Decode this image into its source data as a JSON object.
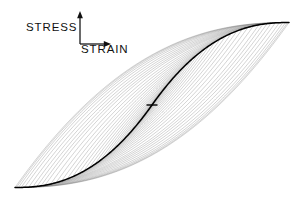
{
  "figure": {
    "background_color": "#ffffff",
    "width": 306,
    "height": 203
  },
  "axes": {
    "origin": {
      "x": 80,
      "y": 44
    },
    "vertical": {
      "label": "STRESS",
      "direction": "up",
      "tip": {
        "x": 80,
        "y": 11
      },
      "icon": "up-arrow-icon",
      "color": "#111111"
    },
    "horizontal": {
      "label": "STRAIN",
      "direction": "right",
      "tip": {
        "x": 111,
        "y": 44
      },
      "icon": "right-arrow-icon",
      "color": "#111111"
    }
  },
  "chart_data": {
    "type": "line",
    "title": "",
    "subtitle": "",
    "xlabel": "STRAIN",
    "ylabel": "STRESS",
    "grid": false,
    "legend": null,
    "axis_style": "arrow-indicator-only",
    "tick_labels": {
      "x": [],
      "y": []
    },
    "center": {
      "x": 152,
      "y": 105
    },
    "extent": {
      "bottom_left_tip": {
        "x": 19,
        "y": 192
      },
      "top_right_tip": {
        "x": 293,
        "y": 27
      }
    },
    "loop_count": 28,
    "loop_color": "#4a4a4a",
    "loop_opacity": 0.55,
    "loop_stroke_width": 0.45,
    "backbone": {
      "name": "skeleton-curve",
      "color": "#000000",
      "stroke_width": 1.5,
      "shape": "antisymmetric-S",
      "start": {
        "x": 19,
        "y": 192
      },
      "end": {
        "x": 293,
        "y": 27
      }
    },
    "center_marker": {
      "name": "center-tick",
      "color": "#000000",
      "width": 11,
      "height": 1.4
    },
    "series": [
      {
        "name": "backbone",
        "role": "skeleton-curve",
        "points_normalized": [
          [
            -1.0,
            -1.0
          ],
          [
            -0.86,
            -0.925
          ],
          [
            -0.72,
            -0.845
          ],
          [
            -0.58,
            -0.755
          ],
          [
            -0.44,
            -0.645
          ],
          [
            -0.32,
            -0.53
          ],
          [
            -0.22,
            -0.405
          ],
          [
            -0.14,
            -0.285
          ],
          [
            -0.07,
            -0.15
          ],
          [
            0.0,
            0.0
          ],
          [
            0.07,
            0.15
          ],
          [
            0.14,
            0.285
          ],
          [
            0.22,
            0.405
          ],
          [
            0.32,
            0.53
          ],
          [
            0.44,
            0.645
          ],
          [
            0.58,
            0.755
          ],
          [
            0.72,
            0.845
          ],
          [
            0.86,
            0.925
          ],
          [
            1.0,
            1.0
          ]
        ]
      },
      {
        "name": "hysteresis-loops",
        "role": "nested-loops",
        "amplitudes_normalized": [
          0.06,
          0.1,
          0.14,
          0.18,
          0.22,
          0.26,
          0.3,
          0.34,
          0.38,
          0.42,
          0.46,
          0.5,
          0.54,
          0.58,
          0.62,
          0.66,
          0.7,
          0.74,
          0.78,
          0.81,
          0.84,
          0.87,
          0.9,
          0.93,
          0.955,
          0.975,
          0.99,
          1.0
        ]
      }
    ]
  }
}
